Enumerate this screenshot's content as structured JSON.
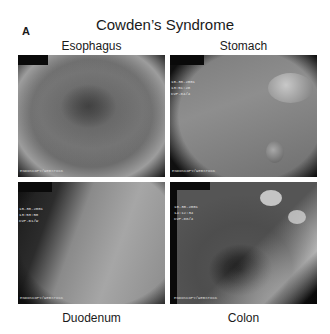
{
  "figure": {
    "panel_letter": "A",
    "title": "Cowden’s Syndrome",
    "panels": [
      {
        "label": "Esophagus",
        "overlay_text": "",
        "footer_text": "ENDOSCOPY/WEBSTOCK",
        "description": "Endoscopic view of esophagus lumen, dark central opening with diffuse whitish nodules"
      },
      {
        "label": "Stomach",
        "overlay_text": "10.30.2001\n13:51:28\nCVP-84/4",
        "footer_text": "ENDOSCOPY/WEBSTOCK",
        "description": "Endoscopic view of stomach mucosa with polyps"
      },
      {
        "label": "Duodenum",
        "overlay_text": "10.30.2001\n13:53:50\nCVP-61/W",
        "footer_text": "ENDOSCOPY/WEBSTOCK",
        "description": "Endoscopic view of duodenum with folds, dark lumen on left"
      },
      {
        "label": "Colon",
        "overlay_text": "10.30.2001\n14:12:34\nCVP-88/4",
        "footer_text": "ENDOSCOPY/WEBSTOCK",
        "description": "Endoscopic view of colon lumen with multiple polyps"
      }
    ]
  }
}
